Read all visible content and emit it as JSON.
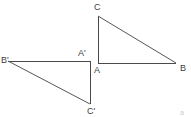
{
  "figure": {
    "background_color": "#ffffff",
    "stroke_color": "#4a4a4a",
    "stroke_width": 1,
    "label_color": "#3d3d3d",
    "width": 191,
    "height": 117
  },
  "triangles": [
    {
      "name": "original-triangle",
      "id": "ABC",
      "vertices": [
        {
          "label": "A",
          "x": 98,
          "y": 63,
          "label_x": 94,
          "label_y": 66
        },
        {
          "label": "B",
          "x": 176,
          "y": 63,
          "label_x": 180,
          "label_y": 64
        },
        {
          "label": "C",
          "x": 98,
          "y": 16,
          "label_x": 94,
          "label_y": 3
        }
      ],
      "edges": [
        {
          "name": "edge-AB",
          "from": "A",
          "to": "B"
        },
        {
          "name": "edge-AC",
          "from": "A",
          "to": "C"
        },
        {
          "name": "edge-CB",
          "from": "C",
          "to": "B"
        }
      ]
    },
    {
      "name": "image-triangle",
      "id": "A'B'C'",
      "vertices": [
        {
          "label": "A'",
          "x": 90,
          "y": 61,
          "label_x": 78,
          "label_y": 49
        },
        {
          "label": "B'",
          "x": 8,
          "y": 61,
          "label_x": 1,
          "label_y": 56
        },
        {
          "label": "C'",
          "x": 90,
          "y": 104,
          "label_x": 87,
          "label_y": 107
        }
      ],
      "edges": [
        {
          "name": "edge-A-prime-B-prime",
          "from": "A'",
          "to": "B'"
        },
        {
          "name": "edge-A-prime-C-prime",
          "from": "A'",
          "to": "C'"
        },
        {
          "name": "edge-B-prime-C-prime",
          "from": "B'",
          "to": "C'"
        }
      ]
    }
  ],
  "labels": {
    "C": "C",
    "A": "A",
    "B": "B",
    "A_prime": "A'",
    "B_prime": "B'",
    "C_prime": "C'"
  },
  "artifact": {
    "text": "a",
    "x": 180,
    "y": 109
  }
}
